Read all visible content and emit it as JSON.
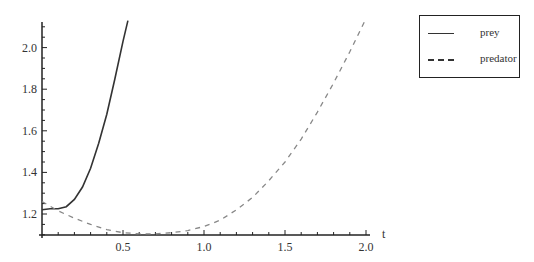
{
  "chart_data": {
    "type": "line",
    "title": "",
    "xlabel": "t",
    "ylabel": "",
    "xlim": [
      0,
      2.0
    ],
    "ylim": [
      1.1,
      2.13
    ],
    "grid": false,
    "legend_position": "right-top",
    "x_ticks": [
      "0.5",
      "1.0",
      "1.5",
      "2.0"
    ],
    "y_ticks": [
      "1.2",
      "1.4",
      "1.6",
      "1.8",
      "2.0"
    ],
    "legend": [
      "prey",
      "predator"
    ],
    "series": [
      {
        "name": "prey",
        "style": "solid",
        "color": "#333333",
        "x": [
          0,
          0.05,
          0.1,
          0.15,
          0.2,
          0.25,
          0.3,
          0.35,
          0.4,
          0.45,
          0.5,
          0.53
        ],
        "y": [
          1.22,
          1.225,
          1.225,
          1.235,
          1.27,
          1.33,
          1.42,
          1.54,
          1.68,
          1.85,
          2.03,
          2.13
        ]
      },
      {
        "name": "predator",
        "style": "dashed",
        "color": "#888888",
        "x": [
          0,
          0.1,
          0.2,
          0.3,
          0.4,
          0.5,
          0.6,
          0.7,
          0.8,
          0.9,
          1.0,
          1.1,
          1.2,
          1.3,
          1.4,
          1.5,
          1.6,
          1.7,
          1.8,
          1.9,
          2.0
        ],
        "y": [
          1.26,
          1.215,
          1.18,
          1.15,
          1.125,
          1.11,
          1.105,
          1.105,
          1.11,
          1.12,
          1.14,
          1.17,
          1.22,
          1.28,
          1.36,
          1.45,
          1.56,
          1.69,
          1.83,
          1.98,
          2.14
        ]
      }
    ]
  },
  "axis": {
    "x_label": "t"
  },
  "legend": {
    "items": [
      {
        "label": "prey",
        "style": "solid"
      },
      {
        "label": "predator",
        "style": "dashed"
      }
    ]
  }
}
